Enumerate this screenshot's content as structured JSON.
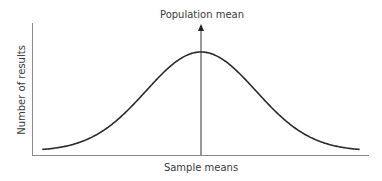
{
  "chart_data": {
    "type": "line",
    "title": "",
    "xlabel": "Sample means",
    "ylabel": "Number of results",
    "annotations": [
      {
        "text": "Population mean",
        "position": "peak",
        "style": "vertical arrow from x-axis to above curve peak"
      }
    ],
    "x": [
      -3,
      -2.5,
      -2,
      -1.5,
      -1,
      -0.5,
      0,
      0.5,
      1,
      1.5,
      2,
      2.5,
      3
    ],
    "series": [
      {
        "name": "Distribution of sample means (normal curve)",
        "values": [
          0.011,
          0.044,
          0.135,
          0.325,
          0.607,
          0.882,
          1.0,
          0.882,
          0.607,
          0.325,
          0.135,
          0.044,
          0.011
        ]
      }
    ],
    "grid": false,
    "legend": "none",
    "axis_ticks": "none"
  },
  "labels": {
    "annotation": "Population mean",
    "x_axis": "Sample means",
    "y_axis": "Number of results"
  },
  "colors": {
    "curve": "#2b2b2b",
    "axes": "#8a8a8a",
    "arrow": "#333333",
    "text": "#3a3a3a"
  }
}
